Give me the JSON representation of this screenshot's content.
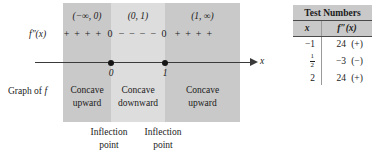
{
  "diagram": {
    "function_label": "f″(x)",
    "axis_label": "x",
    "graph_of_label_prefix": "Graph of ",
    "graph_of_label_italic": "f",
    "intervals": [
      {
        "label": "(−∞, 0)",
        "signs": "+ + + + ",
        "concavity_line1": "Concave",
        "concavity_line2": "upward"
      },
      {
        "label": "(0, 1)",
        "signs": "− − − −",
        "concavity_line1": "Concave",
        "concavity_line2": "downward"
      },
      {
        "label": "(1, ∞)",
        "signs": "+ + + +",
        "concavity_line1": "Concave",
        "concavity_line2": "upward"
      }
    ],
    "critical_points": [
      {
        "value": "0",
        "zero_marker": "0"
      },
      {
        "value": "1",
        "zero_marker": "0"
      }
    ],
    "inflection_notes": [
      {
        "line1": "Inflection",
        "line2": "point"
      },
      {
        "line1": "Inflection",
        "line2": "point"
      }
    ]
  },
  "table": {
    "title": "Test Numbers",
    "columns": [
      "x",
      "f″(x)"
    ],
    "rows": [
      {
        "x": "−1",
        "x_is_fraction": false,
        "value": "24",
        "sign": "(+)"
      },
      {
        "x": "1/2",
        "x_is_fraction": true,
        "numerator": "1",
        "denominator": "2",
        "value": "−3",
        "sign": "(−)"
      },
      {
        "x": "2",
        "x_is_fraction": false,
        "value": "24",
        "sign": "(+)"
      }
    ]
  },
  "colors": {
    "band_outer": "#c9c9c9",
    "band_inner": "#dddddd",
    "axis": "#3a3a3a",
    "text": "#1b1b1b"
  }
}
